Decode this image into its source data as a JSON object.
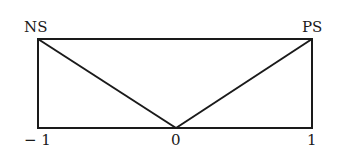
{
  "diagram": {
    "labels": {
      "top_left": "NS",
      "top_right": "PS",
      "axis_left": "− 1",
      "axis_center": "0",
      "axis_right": "1"
    },
    "colors": {
      "stroke": "#1a1a1a",
      "background": "#ffffff"
    },
    "shape": "rectangle with two diagonals from top corners meeting at bottom center (membership functions NS and PS)"
  }
}
